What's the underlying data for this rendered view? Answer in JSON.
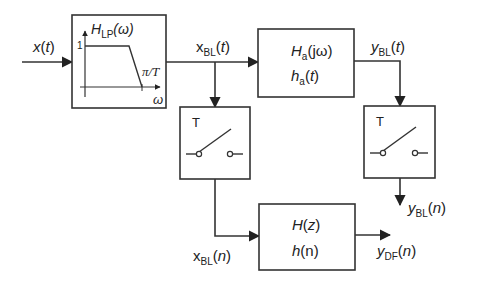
{
  "diagram": {
    "type": "signal-processing block diagram",
    "colors": {
      "background": "#ffffff",
      "stroke": "#333333",
      "text": "#222222"
    },
    "signals": {
      "input": {
        "base": "x",
        "sub": "",
        "arg": "(t)"
      },
      "bandlimited_continuous": {
        "base": "x",
        "sub": "BL",
        "arg": "(t)"
      },
      "analog_output": {
        "base": "y",
        "sub": "BL",
        "arg": "(t)"
      },
      "bandlimited_sampled": {
        "base": "x",
        "sub": "BL",
        "arg": "(n)"
      },
      "analog_output_sampled": {
        "base": "y",
        "sub": "BL",
        "arg": "(n)"
      },
      "digital_output": {
        "base": "y",
        "sub": "DF",
        "arg": "(n)"
      }
    },
    "blocks": {
      "lowpass": {
        "title_base": "H",
        "title_sub": "LP",
        "title_arg": "(ω)",
        "y_tick": "1",
        "cutoff_label": "π/T",
        "x_axis_label": "ω"
      },
      "analog_filter": {
        "line1_base": "H",
        "line1_sub": "a",
        "line1_arg": "(jω)",
        "line2_base": "h",
        "line2_sub": "a",
        "line2_arg": "(t)"
      },
      "sampler_left": {
        "label": "T"
      },
      "sampler_right": {
        "label": "T"
      },
      "digital_filter": {
        "line1_base": "H",
        "line1_arg": "(z)",
        "line2_base": "h",
        "line2_arg": "(n)"
      }
    }
  }
}
